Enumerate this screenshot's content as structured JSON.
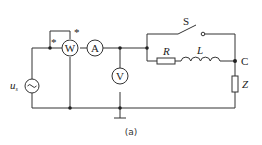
{
  "diagram": {
    "type": "circuit",
    "caption": "(a)",
    "source": {
      "label_main": "u",
      "label_sub": "s",
      "symbol": "~"
    },
    "meters": {
      "wattmeter": "W",
      "ammeter": "A",
      "voltmeter": "V",
      "polarity_mark": "*"
    },
    "components": {
      "switch": "S",
      "resistor": "R",
      "inductor": "L",
      "impedance": "Z",
      "node": "C"
    }
  }
}
